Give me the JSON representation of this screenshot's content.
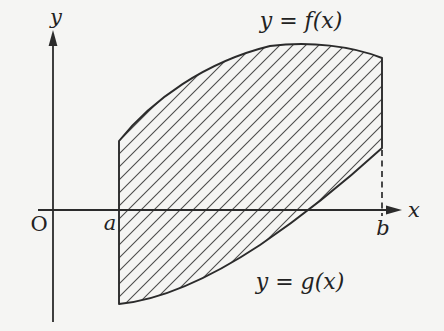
{
  "figure": {
    "axes": {
      "x_label": "x",
      "y_label": "y",
      "origin_label": "O"
    },
    "x_points": {
      "a_label": "a",
      "b_label": "b"
    },
    "curves": {
      "upper_label": "y = f(x)",
      "lower_label": "y = g(x)"
    },
    "region": {
      "description": "hatched region between y=f(x) and y=g(x) from x=a to x=b"
    },
    "colors": {
      "background": "#f5f5f3",
      "line": "#2b2b2b",
      "hatch": "#4c4c4c"
    }
  }
}
